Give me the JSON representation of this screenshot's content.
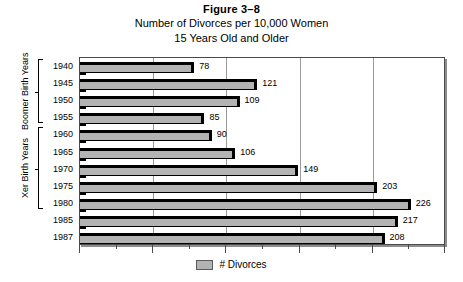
{
  "figure": {
    "number": "Figure 3–8",
    "title_line1": "Number of Divorces per 10,000 Women",
    "title_line2": "15 Years Old and Older"
  },
  "groups": {
    "boomer_label": "Boomer Birth Years",
    "xer_label": "Xer Birth Years"
  },
  "legend": {
    "series_label": "# Divorces",
    "swatch_color": "#b3b3b3"
  },
  "chart_data": {
    "type": "bar",
    "orientation": "horizontal",
    "title": "Number of Divorces per 10,000 Women 15 Years Old and Older",
    "xlabel": "",
    "ylabel": "",
    "categories": [
      "1940",
      "1945",
      "1950",
      "1955",
      "1960",
      "1965",
      "1970",
      "1975",
      "1980",
      "1985",
      "1987"
    ],
    "values": [
      78,
      121,
      109,
      85,
      90,
      106,
      149,
      203,
      226,
      217,
      208
    ],
    "series": [
      {
        "name": "# Divorces",
        "values": [
          78,
          121,
          109,
          85,
          90,
          106,
          149,
          203,
          226,
          217,
          208
        ]
      }
    ],
    "xlim": [
      0,
      250
    ],
    "gridlines": [
      50,
      100,
      150,
      200
    ],
    "minor_tick_step": 25,
    "grid": true,
    "legend_position": "bottom",
    "bar_color": "#b3b3b3",
    "annotations": [
      {
        "text": "Boomer Birth Years",
        "spans": [
          "1940",
          "1955"
        ]
      },
      {
        "text": "Xer Birth Years",
        "spans": [
          "1960",
          "1980"
        ]
      }
    ]
  }
}
